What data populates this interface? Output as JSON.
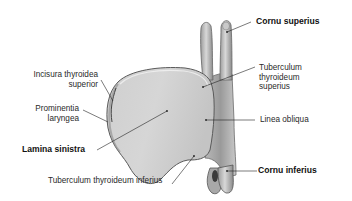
{
  "figure": {
    "colors": {
      "background": "#ffffff",
      "cartilage_light": "#d9d9d9",
      "cartilage_mid": "#bdbdbd",
      "cartilage_dark": "#7a7a7a",
      "outline": "#5a5a5a",
      "leader_line": "#222222",
      "text": "#2a2a2a"
    }
  },
  "labels": {
    "cornu_superius": "Cornu superius",
    "incisura_line1": "Incisura thyroidea",
    "incisura_line2": "superior",
    "tuberculum_sup_line1": "Tuberculum",
    "tuberculum_sup_line2": "thyroideum",
    "tuberculum_sup_line3": "superius",
    "prominentia_line1": "Prominentia",
    "prominentia_line2": "laryngea",
    "linea_obliqua": "Linea obliqua",
    "lamina_sinistra": "Lamina sinistra",
    "tuberculum_inf": "Tuberculum thyroideum inferius",
    "cornu_inferius": "Cornu inferius"
  }
}
